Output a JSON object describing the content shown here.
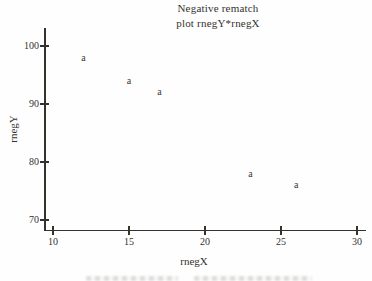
{
  "title": {
    "line1": "Negative rematch",
    "line2": "plot rnegY*rnegX"
  },
  "chart_data": {
    "type": "scatter",
    "title": "Negative rematch plot rnegY*rnegX",
    "xlabel": "rnegX",
    "ylabel": "rnegY",
    "marker_char": "a",
    "xlim": [
      10,
      30
    ],
    "ylim": [
      70,
      100
    ],
    "x_ticks": [
      10,
      15,
      20,
      25,
      30
    ],
    "y_ticks": [
      70,
      80,
      90,
      100
    ],
    "grid": false,
    "legend": null,
    "points": [
      {
        "x": 12,
        "y": 98
      },
      {
        "x": 15,
        "y": 94
      },
      {
        "x": 17,
        "y": 92
      },
      {
        "x": 23,
        "y": 78
      },
      {
        "x": 26,
        "y": 76
      }
    ]
  },
  "colors": {
    "ink": "#35322e",
    "paper": "#fefefe",
    "caption_artifact": "#6e6c68"
  }
}
